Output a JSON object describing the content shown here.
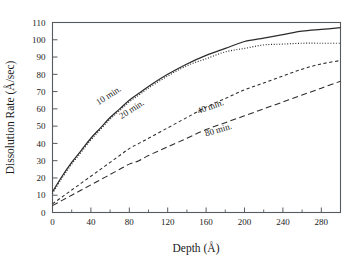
{
  "chart_data": {
    "type": "line",
    "title": "",
    "xlabel": "Depth (Å)",
    "ylabel": "Dissolution Rate (Å/sec)",
    "xlim": [
      0,
      300
    ],
    "ylim": [
      0,
      110
    ],
    "xticks": [
      0,
      40,
      80,
      120,
      160,
      200,
      240,
      280
    ],
    "xticklabels": [
      "0",
      "40",
      "80",
      "120",
      "160",
      "200",
      "240",
      "280"
    ],
    "xminor_step": 20,
    "yticks": [
      0,
      10,
      20,
      30,
      40,
      50,
      60,
      70,
      80,
      90,
      100,
      110
    ],
    "yticklabels": [
      "0",
      "10",
      "20",
      "30",
      "40",
      "50",
      "60",
      "70",
      "80",
      "90",
      "100",
      "110"
    ],
    "grid": false,
    "legend": "inline-curve-labels",
    "x": [
      0,
      10,
      20,
      30,
      40,
      50,
      60,
      70,
      80,
      90,
      100,
      120,
      140,
      160,
      180,
      200,
      220,
      240,
      260,
      280,
      300
    ],
    "series": [
      {
        "name": "10 min.",
        "label": "10 min.",
        "linestyle": "solid",
        "color": "#2b2b2b",
        "values": [
          12,
          21,
          29,
          36,
          43,
          49,
          55,
          60,
          65,
          69,
          73,
          80,
          86,
          91,
          95,
          99,
          101,
          103,
          105,
          106,
          107
        ]
      },
      {
        "name": "20 min.",
        "label": "20 min.",
        "linestyle": "dotted",
        "color": "#2b2b2b",
        "values": [
          11,
          20,
          28,
          35,
          42,
          48,
          54,
          59,
          64,
          68,
          72,
          79,
          85,
          89,
          93,
          95,
          97,
          97.5,
          98,
          98,
          98
        ]
      },
      {
        "name": "40 min.",
        "label": "40 min.",
        "linestyle": "dashed-short",
        "color": "#2b2b2b",
        "values": [
          5,
          9,
          13,
          17,
          21,
          25,
          29,
          33,
          37,
          40,
          43,
          49,
          55,
          61,
          66,
          71,
          75,
          79,
          83,
          86,
          88
        ]
      },
      {
        "name": "80 min.",
        "label": "80 min.",
        "linestyle": "dashed-long",
        "color": "#2b2b2b",
        "values": [
          4,
          7,
          10,
          13,
          16,
          19,
          22,
          25,
          28,
          30,
          33,
          38,
          43,
          48,
          52,
          56,
          60,
          64,
          68,
          72,
          76
        ]
      }
    ],
    "annotations": [
      {
        "text": "10 min.",
        "x": 48,
        "y": 62,
        "rotation": -33
      },
      {
        "text": "20 min.",
        "x": 72,
        "y": 54,
        "rotation": -33
      },
      {
        "text": "40 min.",
        "x": 152,
        "y": 57,
        "rotation": -20
      },
      {
        "text": "80 min.",
        "x": 160,
        "y": 44,
        "rotation": -17
      }
    ]
  }
}
